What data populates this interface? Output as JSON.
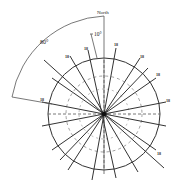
{
  "diagram": {
    "type": "rose-diagram",
    "north_label": "North",
    "angle_labels": {
      "wide": "80°",
      "narrow": "10°"
    },
    "center": [
      104,
      114
    ],
    "outer_radius": 56,
    "inner_dashed_radii": [
      38,
      25
    ],
    "line_label": "18",
    "colors": {
      "line": "#333333",
      "background": "#ffffff"
    },
    "lines": [
      {
        "angle_deg": 10,
        "labeled": true
      },
      {
        "angle_deg": 30,
        "labeled": true
      },
      {
        "angle_deg": 55,
        "labeled": true
      },
      {
        "angle_deg": 80,
        "labeled": true
      },
      {
        "angle_deg": 120,
        "labeled": true
      },
      {
        "angle_deg": 160,
        "labeled": false
      },
      {
        "angle_deg": -15,
        "labeled": true
      },
      {
        "angle_deg": -35,
        "labeled": true
      },
      {
        "angle_deg": -60,
        "labeled": false
      },
      {
        "angle_deg": -80,
        "labeled": true
      }
    ]
  }
}
